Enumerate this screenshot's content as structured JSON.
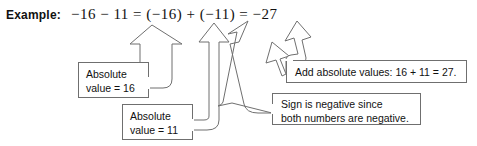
{
  "example": {
    "label": "Example:",
    "equation": "−16 − 11 = (−16) + (−11) = −27"
  },
  "callouts": [
    {
      "id": "abs16",
      "line1": "Absolute",
      "line2": "value = 16"
    },
    {
      "id": "abs11",
      "line1": "Absolute",
      "line2": "value = 11"
    },
    {
      "id": "add",
      "line1": "Add absolute values: 16 + 11 = 27."
    },
    {
      "id": "sign",
      "line1": "Sign is negative since",
      "line2": "both numbers are negative."
    }
  ],
  "arrows": {
    "count": 5,
    "outline_color": "#6f6f6f",
    "fill_color": "#ffffff",
    "targets": [
      "−16",
      "11",
      "(−16)",
      "sign of −27",
      "27"
    ]
  }
}
